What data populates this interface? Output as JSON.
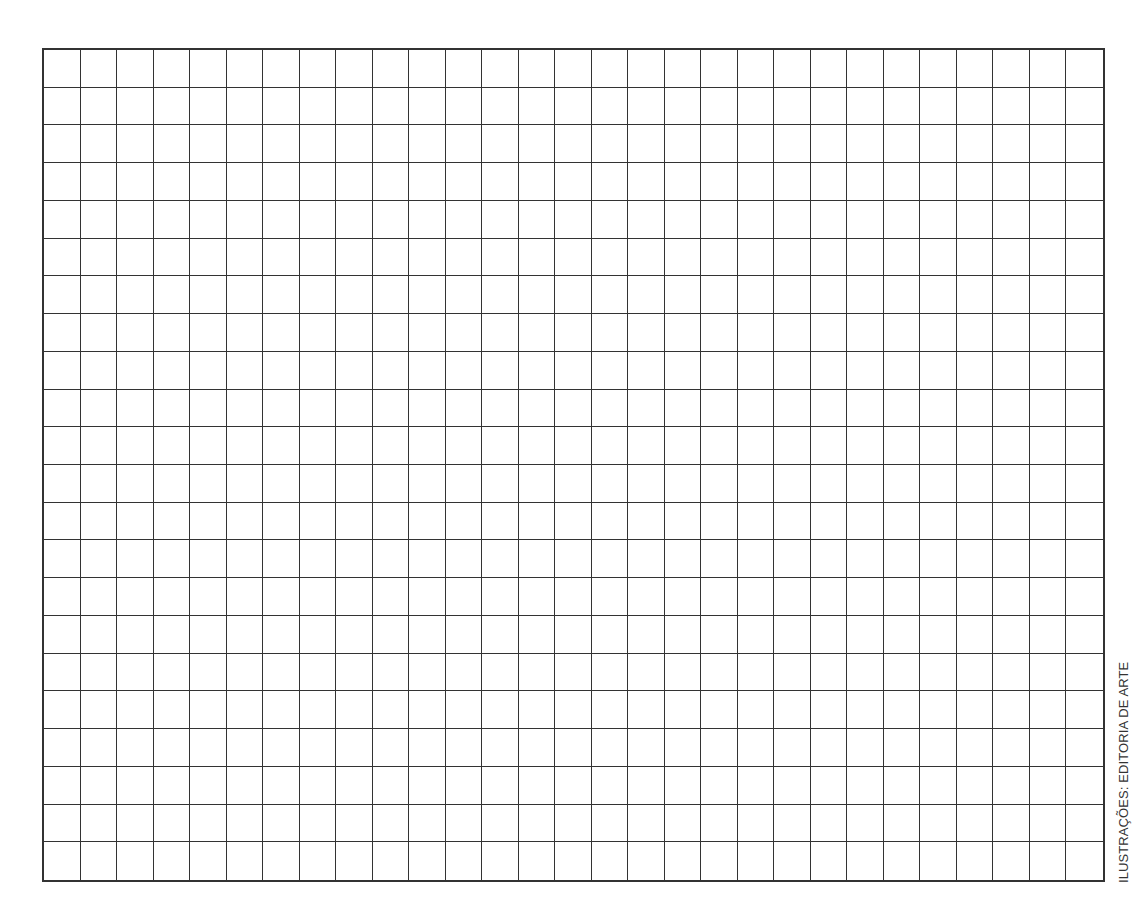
{
  "grid": {
    "columns": 29,
    "rows": 22,
    "line_color": "#333333",
    "background": "#ffffff"
  },
  "credit": {
    "text": "ILUSTRAÇÕES: EDITORIA DE ARTE"
  }
}
